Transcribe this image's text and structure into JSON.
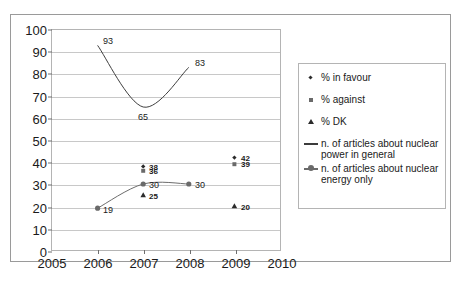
{
  "chart_data": {
    "type": "line",
    "title": "",
    "xlabel": "",
    "ylabel": "",
    "xlim": [
      2005,
      2010
    ],
    "ylim": [
      0,
      100
    ],
    "grid": true,
    "legend_position": "right",
    "x_ticks": [
      "2005",
      "2006",
      "2007",
      "2008",
      "2009",
      "2010"
    ],
    "y_ticks": [
      "0",
      "10",
      "20",
      "30",
      "40",
      "50",
      "60",
      "70",
      "80",
      "90",
      "100"
    ],
    "series": [
      {
        "name": "% in favour",
        "marker": "diamond",
        "color": "#2b2b2b",
        "points": [
          {
            "x": 2007,
            "y": 38,
            "label": "38"
          },
          {
            "x": 2009,
            "y": 42,
            "label": "42"
          }
        ]
      },
      {
        "name": "% against",
        "marker": "square",
        "color": "#6a6a6a",
        "points": [
          {
            "x": 2007,
            "y": 36,
            "label": "36"
          },
          {
            "x": 2009,
            "y": 39,
            "label": "39"
          }
        ]
      },
      {
        "name": "% DK",
        "marker": "triangle",
        "color": "#2b2b2b",
        "points": [
          {
            "x": 2007,
            "y": 25,
            "label": "25"
          },
          {
            "x": 2009,
            "y": 20,
            "label": "20"
          }
        ]
      },
      {
        "name": "n. of articles about nuclear power in general",
        "marker": "line",
        "color": "#3c3c3c",
        "points": [
          {
            "x": 2006,
            "y": 93,
            "label": "93"
          },
          {
            "x": 2007,
            "y": 65,
            "label": "65"
          },
          {
            "x": 2008,
            "y": 83,
            "label": "83"
          }
        ]
      },
      {
        "name": "n. of articles about nuclear energy only",
        "marker": "line-circle",
        "color": "#6a6a6a",
        "points": [
          {
            "x": 2006,
            "y": 19,
            "label": "19"
          },
          {
            "x": 2007,
            "y": 30,
            "label": "30"
          },
          {
            "x": 2008,
            "y": 30,
            "label": "30"
          }
        ]
      }
    ]
  },
  "legend": {
    "items": [
      {
        "label": "% in favour",
        "marker": "diamond-icon"
      },
      {
        "label": "% against",
        "marker": "square-icon"
      },
      {
        "label": "% DK",
        "marker": "triangle-icon"
      },
      {
        "label": "n. of articles about nuclear power in general",
        "marker": "line-icon"
      },
      {
        "label": "n. of articles about nuclear energy only",
        "marker": "line-circle-icon"
      }
    ]
  }
}
